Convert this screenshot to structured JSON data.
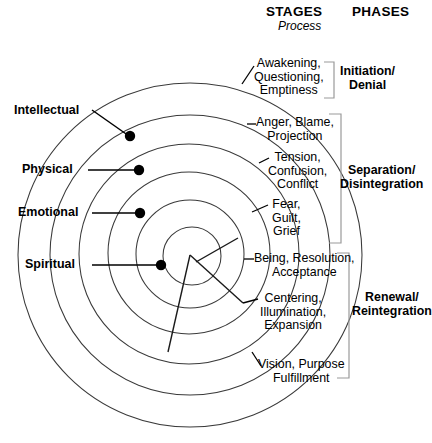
{
  "header": {
    "stages_title": "STAGES",
    "stages_subtitle": "Process",
    "phases_title": "PHASES"
  },
  "dimensions": {
    "labels": [
      {
        "name": "intellectual",
        "text": "Intellectual"
      },
      {
        "name": "physical",
        "text": "Physical"
      },
      {
        "name": "emotional",
        "text": "Emotional"
      },
      {
        "name": "spiritual",
        "text": "Spiritual"
      }
    ]
  },
  "stages": [
    {
      "name": "awakening",
      "lines": [
        "Awakening,",
        "Questioning,",
        "Emptiness"
      ]
    },
    {
      "name": "anger",
      "lines": [
        "Anger, Blame,",
        "Projection"
      ]
    },
    {
      "name": "tension",
      "lines": [
        "Tension,",
        "Confusion,",
        "Conflict"
      ]
    },
    {
      "name": "fear",
      "lines": [
        "Fear,",
        "Guilt,",
        "Grief"
      ]
    },
    {
      "name": "being",
      "lines": [
        "Being, Resolution,",
        "Acceptance"
      ]
    },
    {
      "name": "centering",
      "lines": [
        "Centering,",
        "Illumination,",
        "Expansion"
      ]
    },
    {
      "name": "vision",
      "lines": [
        "Vision, Purpose",
        "Fulfillment"
      ]
    }
  ],
  "phases": [
    {
      "name": "initiation-denial",
      "lines": [
        "Initiation/",
        "Denial"
      ]
    },
    {
      "name": "separation-disintegration",
      "lines": [
        "Separation/",
        "Disintegration"
      ]
    },
    {
      "name": "renewal-reintegration",
      "lines": [
        "Renewal/",
        "Reintegration"
      ]
    }
  ],
  "colors": {
    "ink": "#000000",
    "line": "#333333",
    "bracket": "#8a8a8a",
    "background": "#ffffff"
  }
}
